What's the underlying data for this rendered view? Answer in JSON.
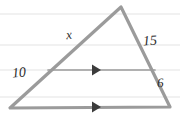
{
  "figure": {
    "type": "geometry-diagram",
    "shape": "triangle",
    "background_color": "#ffffff",
    "stroke_color": "#9b9b9b",
    "inner_line_color": "#9b9b9b",
    "rule_line_color": "#ececec",
    "label_color": "#2b2b2b",
    "canvas": {
      "width": 180,
      "height": 118
    },
    "vertices": {
      "apex": {
        "x": 121,
        "y": 7
      },
      "bottom_left": {
        "x": 10,
        "y": 108
      },
      "bottom_right": {
        "x": 170,
        "y": 107
      }
    },
    "inner_segment": {
      "start": {
        "x": 48,
        "y": 70
      },
      "end": {
        "x": 155,
        "y": 70
      }
    },
    "arrow_markers": [
      {
        "name": "inner-parallel-arrow",
        "x": 96,
        "y": 70
      },
      {
        "name": "base-parallel-arrow",
        "x": 96,
        "y": 107
      }
    ],
    "ruled_lines_y": [
      14,
      45,
      70,
      97
    ],
    "labels": {
      "upper_left_side": "x",
      "upper_right_side": "15",
      "lower_left_side": "10",
      "lower_right_side": "6"
    }
  }
}
